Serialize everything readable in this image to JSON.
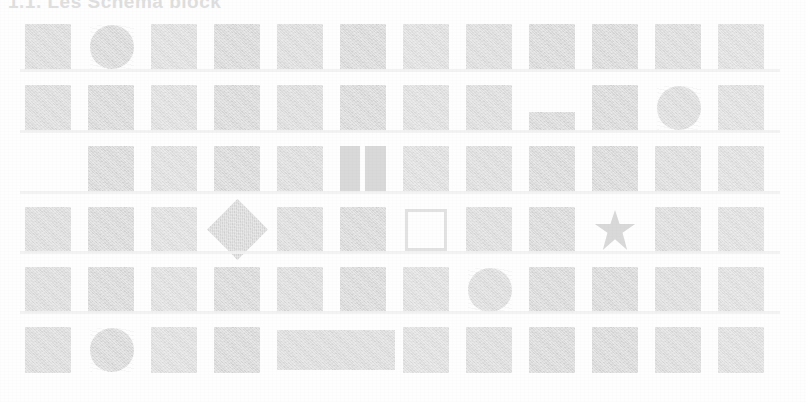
{
  "document": {
    "kind": "scanned-page",
    "heading": "1.1.  Les Schéma block",
    "background_color": "#fefefe",
    "ink_color": "#d9d9d9",
    "columns": 12,
    "rows": 6
  },
  "grid": {
    "rows": [
      {
        "index": 1,
        "cells": [
          {
            "col": 1,
            "shape": "square"
          },
          {
            "col": 2,
            "shape": "circle"
          },
          {
            "col": 3,
            "shape": "square"
          },
          {
            "col": 4,
            "shape": "square"
          },
          {
            "col": 5,
            "shape": "square"
          },
          {
            "col": 6,
            "shape": "square"
          },
          {
            "col": 7,
            "shape": "square"
          },
          {
            "col": 8,
            "shape": "square"
          },
          {
            "col": 9,
            "shape": "square"
          },
          {
            "col": 10,
            "shape": "square"
          },
          {
            "col": 11,
            "shape": "square"
          },
          {
            "col": 12,
            "shape": "square"
          }
        ]
      },
      {
        "index": 2,
        "cells": [
          {
            "col": 1,
            "shape": "square"
          },
          {
            "col": 2,
            "shape": "square"
          },
          {
            "col": 3,
            "shape": "square"
          },
          {
            "col": 4,
            "shape": "square"
          },
          {
            "col": 5,
            "shape": "square"
          },
          {
            "col": 6,
            "shape": "square"
          },
          {
            "col": 7,
            "shape": "square"
          },
          {
            "col": 8,
            "shape": "square"
          },
          {
            "col": 9,
            "shape": "flat-bar"
          },
          {
            "col": 10,
            "shape": "square"
          },
          {
            "col": 11,
            "shape": "circle"
          },
          {
            "col": 12,
            "shape": "square"
          }
        ]
      },
      {
        "index": 3,
        "cells": [
          {
            "col": 2,
            "shape": "square"
          },
          {
            "col": 3,
            "shape": "square"
          },
          {
            "col": 4,
            "shape": "square"
          },
          {
            "col": 5,
            "shape": "square"
          },
          {
            "col": 6,
            "shape": "split-square"
          },
          {
            "col": 7,
            "shape": "square"
          },
          {
            "col": 8,
            "shape": "square"
          },
          {
            "col": 9,
            "shape": "square"
          },
          {
            "col": 10,
            "shape": "square"
          },
          {
            "col": 11,
            "shape": "square"
          },
          {
            "col": 12,
            "shape": "square"
          }
        ]
      },
      {
        "index": 4,
        "cells": [
          {
            "col": 1,
            "shape": "square"
          },
          {
            "col": 2,
            "shape": "square"
          },
          {
            "col": 3,
            "shape": "square"
          },
          {
            "col": 4,
            "shape": "diamond"
          },
          {
            "col": 5,
            "shape": "square"
          },
          {
            "col": 6,
            "shape": "square"
          },
          {
            "col": 7,
            "shape": "hollow-square"
          },
          {
            "col": 8,
            "shape": "square"
          },
          {
            "col": 9,
            "shape": "square"
          },
          {
            "col": 10,
            "shape": "star"
          },
          {
            "col": 11,
            "shape": "square"
          },
          {
            "col": 12,
            "shape": "square"
          }
        ]
      },
      {
        "index": 5,
        "cells": [
          {
            "col": 1,
            "shape": "square"
          },
          {
            "col": 2,
            "shape": "square"
          },
          {
            "col": 3,
            "shape": "square"
          },
          {
            "col": 4,
            "shape": "square"
          },
          {
            "col": 5,
            "shape": "square"
          },
          {
            "col": 6,
            "shape": "square"
          },
          {
            "col": 7,
            "shape": "square"
          },
          {
            "col": 8,
            "shape": "circle"
          },
          {
            "col": 9,
            "shape": "square"
          },
          {
            "col": 10,
            "shape": "square"
          },
          {
            "col": 11,
            "shape": "square"
          },
          {
            "col": 12,
            "shape": "square"
          }
        ]
      },
      {
        "index": 6,
        "cells": [
          {
            "col": 1,
            "shape": "square"
          },
          {
            "col": 2,
            "shape": "circle"
          },
          {
            "col": 3,
            "shape": "square"
          },
          {
            "col": 4,
            "shape": "square"
          },
          {
            "col": 5,
            "shape": "wide-bar"
          },
          {
            "col": 7,
            "shape": "square"
          },
          {
            "col": 8,
            "shape": "square"
          },
          {
            "col": 9,
            "shape": "square"
          },
          {
            "col": 10,
            "shape": "square"
          },
          {
            "col": 11,
            "shape": "square"
          },
          {
            "col": 12,
            "shape": "square"
          }
        ]
      }
    ]
  }
}
